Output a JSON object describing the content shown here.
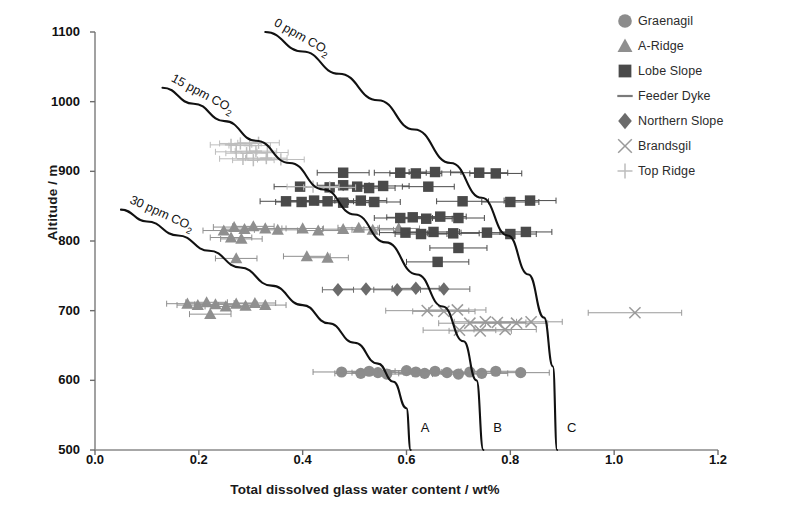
{
  "chart_data": {
    "type": "scatter",
    "title": "",
    "xlabel": "Total dissolved glass water content / wt%",
    "ylabel": "Altitude / m",
    "xlim": [
      0.0,
      1.2
    ],
    "ylim": [
      500,
      1100
    ],
    "xticks": [
      "0.0",
      "0.2",
      "0.4",
      "0.6",
      "0.8",
      "1.0",
      "1.2"
    ],
    "yticks": [
      "500",
      "600",
      "700",
      "800",
      "900",
      "1000",
      "1100"
    ],
    "grid": false,
    "legend_position": "right",
    "series": [
      {
        "name": "Graenagil",
        "marker": "circle",
        "color": "#8c8c8c",
        "points": [
          {
            "x": 0.475,
            "y": 612,
            "xerr": 0.055
          },
          {
            "x": 0.512,
            "y": 610,
            "xerr": 0.05
          },
          {
            "x": 0.528,
            "y": 613,
            "xerr": 0.05
          },
          {
            "x": 0.545,
            "y": 611,
            "xerr": 0.05
          },
          {
            "x": 0.562,
            "y": 609,
            "xerr": 0.05
          },
          {
            "x": 0.6,
            "y": 614,
            "xerr": 0.055
          },
          {
            "x": 0.618,
            "y": 612,
            "xerr": 0.05
          },
          {
            "x": 0.635,
            "y": 610,
            "xerr": 0.05
          },
          {
            "x": 0.655,
            "y": 613,
            "xerr": 0.05
          },
          {
            "x": 0.678,
            "y": 611,
            "xerr": 0.05
          },
          {
            "x": 0.7,
            "y": 609,
            "xerr": 0.05
          },
          {
            "x": 0.722,
            "y": 612,
            "xerr": 0.05
          },
          {
            "x": 0.745,
            "y": 610,
            "xerr": 0.05
          },
          {
            "x": 0.772,
            "y": 613,
            "xerr": 0.05
          },
          {
            "x": 0.82,
            "y": 611,
            "xerr": 0.055
          }
        ]
      },
      {
        "name": "A-Ridge",
        "marker": "triangle",
        "color": "#8f8f8f",
        "points": [
          {
            "x": 0.178,
            "y": 710,
            "xerr": 0.04
          },
          {
            "x": 0.198,
            "y": 708,
            "xerr": 0.04
          },
          {
            "x": 0.215,
            "y": 712,
            "xerr": 0.04
          },
          {
            "x": 0.232,
            "y": 709,
            "xerr": 0.04
          },
          {
            "x": 0.222,
            "y": 695,
            "xerr": 0.04
          },
          {
            "x": 0.252,
            "y": 706,
            "xerr": 0.04
          },
          {
            "x": 0.272,
            "y": 710,
            "xerr": 0.04
          },
          {
            "x": 0.29,
            "y": 707,
            "xerr": 0.04
          },
          {
            "x": 0.308,
            "y": 711,
            "xerr": 0.04
          },
          {
            "x": 0.328,
            "y": 708,
            "xerr": 0.04
          },
          {
            "x": 0.248,
            "y": 815,
            "xerr": 0.04
          },
          {
            "x": 0.268,
            "y": 820,
            "xerr": 0.04
          },
          {
            "x": 0.288,
            "y": 817,
            "xerr": 0.04
          },
          {
            "x": 0.305,
            "y": 821,
            "xerr": 0.04
          },
          {
            "x": 0.262,
            "y": 805,
            "xerr": 0.04
          },
          {
            "x": 0.282,
            "y": 803,
            "xerr": 0.04
          },
          {
            "x": 0.328,
            "y": 818,
            "xerr": 0.04
          },
          {
            "x": 0.352,
            "y": 816,
            "xerr": 0.045
          },
          {
            "x": 0.272,
            "y": 775,
            "xerr": 0.04
          },
          {
            "x": 0.408,
            "y": 778,
            "xerr": 0.045
          },
          {
            "x": 0.448,
            "y": 776,
            "xerr": 0.04
          },
          {
            "x": 0.4,
            "y": 818,
            "xerr": 0.04
          },
          {
            "x": 0.43,
            "y": 815,
            "xerr": 0.04
          },
          {
            "x": 0.478,
            "y": 817,
            "xerr": 0.04
          },
          {
            "x": 0.508,
            "y": 819,
            "xerr": 0.04
          },
          {
            "x": 0.535,
            "y": 816,
            "xerr": 0.04
          },
          {
            "x": 0.585,
            "y": 818,
            "xerr": 0.04
          }
        ]
      },
      {
        "name": "Lobe Slope",
        "marker": "square",
        "color": "#4a4a4a",
        "points": [
          {
            "x": 0.478,
            "y": 898,
            "xerr": 0.05
          },
          {
            "x": 0.588,
            "y": 898,
            "xerr": 0.05
          },
          {
            "x": 0.618,
            "y": 897,
            "xerr": 0.05
          },
          {
            "x": 0.655,
            "y": 899,
            "xerr": 0.05
          },
          {
            "x": 0.74,
            "y": 898,
            "xerr": 0.055
          },
          {
            "x": 0.772,
            "y": 897,
            "xerr": 0.05
          },
          {
            "x": 0.395,
            "y": 878,
            "xerr": 0.05
          },
          {
            "x": 0.452,
            "y": 877,
            "xerr": 0.05
          },
          {
            "x": 0.478,
            "y": 880,
            "xerr": 0.05
          },
          {
            "x": 0.505,
            "y": 878,
            "xerr": 0.05
          },
          {
            "x": 0.528,
            "y": 876,
            "xerr": 0.05
          },
          {
            "x": 0.555,
            "y": 879,
            "xerr": 0.05
          },
          {
            "x": 0.642,
            "y": 878,
            "xerr": 0.05
          },
          {
            "x": 0.368,
            "y": 857,
            "xerr": 0.05
          },
          {
            "x": 0.398,
            "y": 856,
            "xerr": 0.05
          },
          {
            "x": 0.422,
            "y": 858,
            "xerr": 0.05
          },
          {
            "x": 0.448,
            "y": 857,
            "xerr": 0.05
          },
          {
            "x": 0.478,
            "y": 855,
            "xerr": 0.05
          },
          {
            "x": 0.512,
            "y": 858,
            "xerr": 0.05
          },
          {
            "x": 0.538,
            "y": 856,
            "xerr": 0.05
          },
          {
            "x": 0.708,
            "y": 857,
            "xerr": 0.05
          },
          {
            "x": 0.8,
            "y": 856,
            "xerr": 0.055
          },
          {
            "x": 0.838,
            "y": 858,
            "xerr": 0.05
          },
          {
            "x": 0.588,
            "y": 833,
            "xerr": 0.05
          },
          {
            "x": 0.612,
            "y": 834,
            "xerr": 0.05
          },
          {
            "x": 0.638,
            "y": 832,
            "xerr": 0.05
          },
          {
            "x": 0.665,
            "y": 835,
            "xerr": 0.05
          },
          {
            "x": 0.7,
            "y": 833,
            "xerr": 0.05
          },
          {
            "x": 0.598,
            "y": 812,
            "xerr": 0.05
          },
          {
            "x": 0.628,
            "y": 810,
            "xerr": 0.05
          },
          {
            "x": 0.652,
            "y": 813,
            "xerr": 0.05
          },
          {
            "x": 0.69,
            "y": 811,
            "xerr": 0.05
          },
          {
            "x": 0.755,
            "y": 812,
            "xerr": 0.05
          },
          {
            "x": 0.8,
            "y": 810,
            "xerr": 0.05
          },
          {
            "x": 0.83,
            "y": 813,
            "xerr": 0.05
          },
          {
            "x": 0.7,
            "y": 790,
            "xerr": 0.055
          },
          {
            "x": 0.66,
            "y": 770,
            "xerr": 0.06
          }
        ]
      },
      {
        "name": "Feeder Dyke",
        "marker": "dash",
        "color": "#7a7a7a",
        "points": []
      },
      {
        "name": "Northern Slope",
        "marker": "diamond",
        "color": "#6b6b6b",
        "points": [
          {
            "x": 0.522,
            "y": 731,
            "xerr": 0.05
          },
          {
            "x": 0.582,
            "y": 730,
            "xerr": 0.045
          },
          {
            "x": 0.618,
            "y": 732,
            "xerr": 0.045
          },
          {
            "x": 0.672,
            "y": 731,
            "xerr": 0.05
          },
          {
            "x": 0.468,
            "y": 730,
            "xerr": 0.03
          }
        ]
      },
      {
        "name": "Brandsgil",
        "marker": "cross",
        "color": "#9a9a9a",
        "points": [
          {
            "x": 0.64,
            "y": 700,
            "xerr": 0.08
          },
          {
            "x": 0.672,
            "y": 699,
            "xerr": 0.06
          },
          {
            "x": 0.698,
            "y": 701,
            "xerr": 0.055
          },
          {
            "x": 0.722,
            "y": 682,
            "xerr": 0.06
          },
          {
            "x": 0.752,
            "y": 684,
            "xerr": 0.06
          },
          {
            "x": 0.775,
            "y": 683,
            "xerr": 0.055
          },
          {
            "x": 0.702,
            "y": 672,
            "xerr": 0.07
          },
          {
            "x": 0.742,
            "y": 671,
            "xerr": 0.06
          },
          {
            "x": 0.79,
            "y": 673,
            "xerr": 0.06
          },
          {
            "x": 0.812,
            "y": 682,
            "xerr": 0.06
          },
          {
            "x": 0.84,
            "y": 684,
            "xerr": 0.06
          },
          {
            "x": 1.04,
            "y": 697,
            "xerr": 0.09
          }
        ]
      },
      {
        "name": "Top Ridge",
        "marker": "plus",
        "color": "#bdbdbd",
        "points": [
          {
            "x": 0.262,
            "y": 938,
            "xerr": 0.04
          },
          {
            "x": 0.28,
            "y": 940,
            "xerr": 0.04
          },
          {
            "x": 0.298,
            "y": 937,
            "xerr": 0.04
          },
          {
            "x": 0.315,
            "y": 941,
            "xerr": 0.04
          },
          {
            "x": 0.272,
            "y": 928,
            "xerr": 0.04
          },
          {
            "x": 0.292,
            "y": 926,
            "xerr": 0.04
          },
          {
            "x": 0.31,
            "y": 929,
            "xerr": 0.04
          },
          {
            "x": 0.332,
            "y": 927,
            "xerr": 0.04
          },
          {
            "x": 0.285,
            "y": 918,
            "xerr": 0.045
          },
          {
            "x": 0.305,
            "y": 916,
            "xerr": 0.04
          },
          {
            "x": 0.33,
            "y": 919,
            "xerr": 0.04
          },
          {
            "x": 0.358,
            "y": 917,
            "xerr": 0.045
          },
          {
            "x": 0.42,
            "y": 878,
            "xerr": 0.05
          },
          {
            "x": 0.452,
            "y": 877,
            "xerr": 0.05
          }
        ]
      }
    ],
    "curves": [
      {
        "label": "30 ppm CO2",
        "label_display": "30 ppm CO",
        "subscript": "2",
        "end_label": "A",
        "points": [
          [
            0.05,
            845
          ],
          [
            0.1,
            828
          ],
          [
            0.16,
            808
          ],
          [
            0.22,
            786
          ],
          [
            0.28,
            762
          ],
          [
            0.34,
            736
          ],
          [
            0.4,
            708
          ],
          [
            0.45,
            682
          ],
          [
            0.5,
            654
          ],
          [
            0.545,
            624
          ],
          [
            0.575,
            598
          ],
          [
            0.6,
            560
          ],
          [
            0.608,
            500
          ]
        ]
      },
      {
        "label": "15 ppm CO2",
        "label_display": "15 ppm CO",
        "subscript": "2",
        "end_label": "B",
        "points": [
          [
            0.13,
            1020
          ],
          [
            0.19,
            997
          ],
          [
            0.25,
            972
          ],
          [
            0.31,
            944
          ],
          [
            0.375,
            912
          ],
          [
            0.44,
            874
          ],
          [
            0.5,
            838
          ],
          [
            0.56,
            798
          ],
          [
            0.62,
            752
          ],
          [
            0.67,
            706
          ],
          [
            0.71,
            656
          ],
          [
            0.735,
            600
          ],
          [
            0.748,
            500
          ]
        ]
      },
      {
        "label": "0 ppm CO2",
        "label_display": "0 ppm CO",
        "subscript": "2",
        "end_label": "C",
        "points": [
          [
            0.328,
            1100
          ],
          [
            0.4,
            1072
          ],
          [
            0.47,
            1040
          ],
          [
            0.545,
            1002
          ],
          [
            0.615,
            960
          ],
          [
            0.685,
            912
          ],
          [
            0.745,
            862
          ],
          [
            0.795,
            808
          ],
          [
            0.835,
            752
          ],
          [
            0.865,
            690
          ],
          [
            0.882,
            620
          ],
          [
            0.89,
            500
          ]
        ]
      }
    ]
  },
  "legend": {
    "items": [
      {
        "label": "Graenagil",
        "marker": "circle",
        "color": "#8c8c8c"
      },
      {
        "label": "A-Ridge",
        "marker": "triangle",
        "color": "#8f8f8f"
      },
      {
        "label": "Lobe Slope",
        "marker": "square",
        "color": "#4a4a4a"
      },
      {
        "label": "Feeder Dyke",
        "marker": "dash",
        "color": "#7a7a7a"
      },
      {
        "label": "Northern Slope",
        "marker": "diamond",
        "color": "#6b6b6b"
      },
      {
        "label": "Brandsgil",
        "marker": "cross",
        "color": "#9a9a9a"
      },
      {
        "label": "Top Ridge",
        "marker": "plus",
        "color": "#bdbdbd"
      }
    ]
  },
  "axes": {
    "x_title": "Total dissolved glass water content / wt%",
    "y_title": "Altitude / m"
  }
}
